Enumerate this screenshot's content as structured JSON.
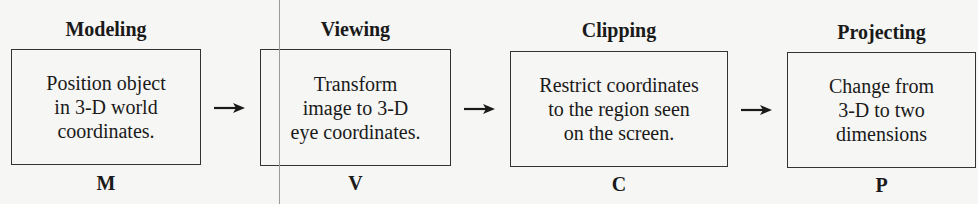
{
  "diagram": {
    "type": "pipeline",
    "stages": [
      {
        "title": "Modeling",
        "text": "Position object\nin 3-D world\ncoordinates.",
        "letter": "M"
      },
      {
        "title": "Viewing",
        "text": "Transform\nimage to 3-D\neye coordinates.",
        "letter": "V"
      },
      {
        "title": "Clipping",
        "text": "Restrict coordinates\nto the region seen\non the screen.",
        "letter": "C"
      },
      {
        "title": "Projecting",
        "text": "Change from\n3-D to two\ndimensions",
        "letter": "P"
      }
    ],
    "arrows": [
      "right-arrow",
      "right-arrow",
      "right-arrow"
    ],
    "colors": {
      "background": "#f6f6f4",
      "ink": "#1a1a1a",
      "box_border": "#333333",
      "artifact_line": "#9a9a9a"
    }
  }
}
